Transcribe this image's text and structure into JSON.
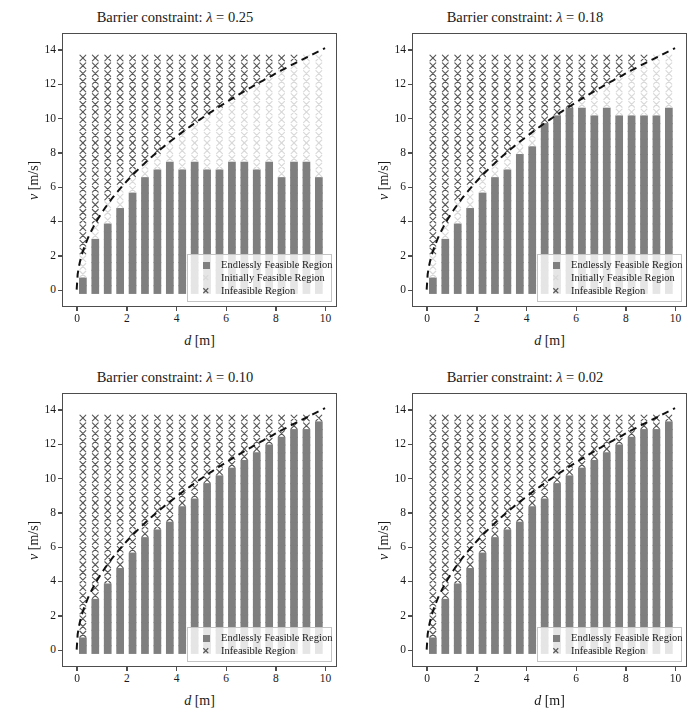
{
  "figure": {
    "width": 700,
    "height": 721,
    "background": "#ffffff"
  },
  "colors": {
    "endlessly_feasible": "#7f7f7f",
    "initially_feasible": "#d9d9d9",
    "infeasible": "#595959",
    "curve": "#111111",
    "axis": "#4d4d4d",
    "text": "#1a1a1a"
  },
  "chart_data": {
    "type": "scatter",
    "xlabel": "d [m]",
    "ylabel": "v [m/s]",
    "xlim": [
      -0.55,
      10.4
    ],
    "ylim": [
      -0.9,
      14.9
    ],
    "xticks": [
      0,
      2,
      4,
      6,
      8,
      10
    ],
    "yticks": [
      0,
      2,
      4,
      6,
      8,
      10,
      12,
      14
    ],
    "grid": false,
    "legend_position": "lower right",
    "grid_x_start": 0.0,
    "grid_x_step": 0.5,
    "grid_x_count": 20,
    "grid_y_start": 0.0,
    "grid_y_step": 0.45,
    "grid_y_count": 31,
    "curve_formula": "v = k * sqrt(d)",
    "curve_k": 4.45,
    "categories": [
      "Endlessly Feasible Region",
      "Initially Feasible Region",
      "Infeasible Region"
    ],
    "panels": [
      {
        "id": "lambda-025",
        "title_prefix": "Barrier constraint: ",
        "title_symbol": "λ",
        "title_eq": " = ",
        "title_value": "0.25",
        "lambda": 0.25,
        "has_initially_feasible": true,
        "legend_items": [
          "Endlessly Feasible Region",
          "Initially Feasible Region",
          "Infeasible Region"
        ],
        "feasible_top": [
          0.45,
          2.7,
          3.6,
          4.5,
          5.4,
          6.3,
          6.75,
          7.2,
          6.75,
          7.2,
          6.75,
          6.75,
          7.2,
          7.2,
          6.75,
          7.2,
          6.3,
          7.2,
          7.2,
          6.3
        ]
      },
      {
        "id": "lambda-018",
        "title_prefix": "Barrier constraint: ",
        "title_symbol": "λ",
        "title_eq": " = ",
        "title_value": "0.18",
        "lambda": 0.18,
        "has_initially_feasible": true,
        "legend_items": [
          "Endlessly Feasible Region",
          "Initially Feasible Region",
          "Infeasible Region"
        ],
        "feasible_top": [
          0.45,
          2.7,
          3.6,
          4.5,
          5.4,
          6.3,
          6.75,
          7.65,
          8.1,
          9.45,
          9.9,
          10.35,
          10.35,
          9.9,
          10.35,
          9.9,
          9.9,
          9.9,
          9.9,
          10.35
        ]
      },
      {
        "id": "lambda-010",
        "title_prefix": "Barrier constraint: ",
        "title_symbol": "λ",
        "title_eq": " = ",
        "title_value": "0.10",
        "lambda": 0.1,
        "has_initially_feasible": false,
        "legend_items": [
          "Endlessly Feasible Region",
          "Infeasible Region"
        ],
        "feasible_top": [
          0.45,
          2.7,
          3.6,
          4.5,
          5.4,
          6.3,
          6.75,
          7.2,
          8.1,
          8.55,
          9.45,
          9.9,
          10.35,
          10.8,
          11.25,
          11.7,
          12.15,
          12.6,
          12.6,
          13.05
        ]
      },
      {
        "id": "lambda-002",
        "title_prefix": "Barrier constraint: ",
        "title_symbol": "λ",
        "title_eq": " = ",
        "title_value": "0.02",
        "lambda": 0.02,
        "has_initially_feasible": false,
        "legend_items": [
          "Endlessly Feasible Region",
          "Infeasible Region"
        ],
        "feasible_top": [
          0.45,
          2.7,
          3.6,
          4.5,
          5.4,
          6.3,
          6.75,
          7.2,
          8.1,
          8.55,
          9.45,
          9.9,
          10.35,
          10.8,
          11.25,
          11.7,
          12.15,
          12.6,
          12.6,
          13.05
        ]
      }
    ]
  },
  "legend_labels": {
    "endlessly": "Endlessly Feasible Region",
    "initially": "Initially Feasible Region",
    "infeasible": "Infeasible Region"
  },
  "axis_labels": {
    "x": "d [m]",
    "y": "v [m/s]",
    "x_var": "d",
    "x_unit": "[m]",
    "y_var": "v",
    "y_unit": "[m/s]"
  }
}
